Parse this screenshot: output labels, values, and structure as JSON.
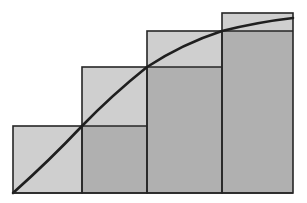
{
  "figure": {
    "title": "Riemann sum step rectangles under a concave increasing curve",
    "background_color": "#ffffff",
    "outline_color": "#262626",
    "outline_width": 1.6,
    "curve_color": "#1f1f1f",
    "curve_width": 2.6,
    "fill_light": "#cfcfcf",
    "fill_dark": "#b0b0b0",
    "canvas": {
      "width": 307,
      "height": 203
    },
    "baseline_y": 193,
    "left_x": 13,
    "right_x": 293
  },
  "chart_data": {
    "type": "bar",
    "title": "Riemann sum step rectangles under a concave increasing curve",
    "subtitle": "",
    "xlabel": "",
    "ylabel": "",
    "grid": false,
    "legend": null,
    "tick_labels_x": [],
    "tick_labels_y": [],
    "axis_ranges": {
      "x": [
        13,
        293
      ],
      "y": [
        193,
        13
      ]
    },
    "categories": [
      "1",
      "2",
      "3",
      "4"
    ],
    "values": [
      67,
      126,
      162,
      180
    ],
    "bars": [
      {
        "index": 1,
        "x_left": 13,
        "x_right": 82,
        "top_y": 126,
        "bottom_y": 193,
        "width": 69,
        "height": 67,
        "fill": "#cfcfcf"
      },
      {
        "index": 2,
        "x_left": 82,
        "x_right": 147,
        "top_y": 67,
        "bottom_y": 193,
        "width": 65,
        "height": 126,
        "fill": "#cfcfcf"
      },
      {
        "index": 3,
        "x_left": 147,
        "x_right": 222,
        "top_y": 31,
        "bottom_y": 193,
        "width": 75,
        "height": 162,
        "fill": "#cfcfcf"
      },
      {
        "index": 4,
        "x_left": 222,
        "x_right": 293,
        "top_y": 13,
        "bottom_y": 193,
        "width": 71,
        "height": 180,
        "fill": "#cfcfcf"
      }
    ],
    "step_levels_y": [
      126,
      67,
      31,
      13
    ],
    "curve": {
      "name": "concave increasing curve",
      "color": "#1f1f1f",
      "points": [
        [
          13,
          193
        ],
        [
          82,
          126
        ],
        [
          147,
          67
        ],
        [
          222,
          31
        ],
        [
          293,
          18
        ]
      ],
      "control_points": [
        [
          13,
          193
        ],
        [
          50,
          160
        ],
        [
          82,
          126
        ],
        [
          112,
          95
        ],
        [
          147,
          67
        ],
        [
          182,
          44
        ],
        [
          222,
          31
        ],
        [
          258,
          22
        ],
        [
          293,
          18
        ]
      ]
    },
    "shaded_regions": [
      {
        "name": "bar-1-light-region",
        "shade": "light",
        "x_left": 13,
        "x_right": 82,
        "y_top": 126,
        "y_bottom": 193
      },
      {
        "name": "bar-2-upper-light-region",
        "shade": "light",
        "x_left": 82,
        "x_right": 147,
        "y_top": 67,
        "y_bottom": 126
      },
      {
        "name": "bar-2-lower-dark-region",
        "shade": "dark",
        "x_left": 82,
        "x_right": 147,
        "y_top": 126,
        "y_bottom": 193
      },
      {
        "name": "bar-3-upper-light-region",
        "shade": "light",
        "x_left": 147,
        "x_right": 222,
        "y_top": 31,
        "y_bottom": 67
      },
      {
        "name": "bar-3-lower-dark-region",
        "shade": "dark",
        "x_left": 147,
        "x_right": 222,
        "y_top": 67,
        "y_bottom": 193
      },
      {
        "name": "bar-4-upper-light-region",
        "shade": "light",
        "x_left": 222,
        "x_right": 293,
        "y_top": 13,
        "y_bottom": 31
      },
      {
        "name": "bar-4-lower-dark-region",
        "shade": "dark",
        "x_left": 222,
        "x_right": 293,
        "y_top": 31,
        "y_bottom": 193
      }
    ],
    "step_connector_lines": [
      {
        "name": "step-line-level-1",
        "x1": 82,
        "y1": 126,
        "x2": 147,
        "y2": 126
      },
      {
        "name": "step-line-level-2",
        "x1": 147,
        "y1": 67,
        "x2": 222,
        "y2": 67
      },
      {
        "name": "step-line-level-3",
        "x1": 222,
        "y1": 31,
        "x2": 293,
        "y2": 31
      }
    ]
  }
}
